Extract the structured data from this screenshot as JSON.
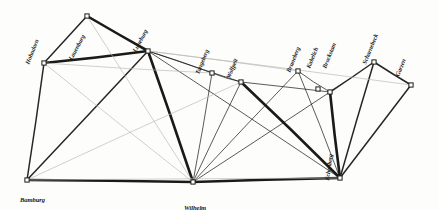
{
  "figure": {
    "kind": "hand-drawn-triangulation-network",
    "background_color": "#fdfdfc",
    "ink_color": "#1a1a18",
    "faint_ink_color": "#b9b9b4",
    "width": 438,
    "height": 210
  },
  "chart_data": {
    "type": "scatter",
    "title": "",
    "subtitle": "",
    "xlabel": "",
    "ylabel": "",
    "grid": false,
    "legend": "none",
    "xlim": [
      0,
      438
    ],
    "ylim": [
      0,
      210
    ],
    "nodes": [
      {
        "id": "hohndorn",
        "label": "Hohndorn",
        "x": 44,
        "y": 63,
        "label_x": 30,
        "label_y": 58,
        "label_rot": -68
      },
      {
        "id": "lauenburg",
        "label": "Lauenburg",
        "x": 87,
        "y": 16,
        "label_x": 73,
        "label_y": 54,
        "label_rot": -62
      },
      {
        "id": "luneburg",
        "label": "Luneburg",
        "x": 148,
        "y": 51,
        "label_x": 137,
        "label_y": 46,
        "label_rot": -62
      },
      {
        "id": "tangeberg",
        "label": "Tangeberg",
        "x": 212,
        "y": 73,
        "label_x": 200,
        "label_y": 68,
        "label_rot": -68
      },
      {
        "id": "wolfpeit",
        "label": "Wolfpeit",
        "x": 241,
        "y": 82,
        "label_x": 231,
        "label_y": 72,
        "label_rot": -68
      },
      {
        "id": "bruneberg",
        "label": "Bruneberg",
        "x": 298,
        "y": 71,
        "label_x": 291,
        "label_y": 66,
        "label_rot": -68
      },
      {
        "id": "kabelich",
        "label": "Kabelich",
        "x": 318,
        "y": 89,
        "label_x": 311,
        "label_y": 62,
        "label_rot": -68
      },
      {
        "id": "brockstam",
        "label": "Brockstam",
        "x": 330,
        "y": 92,
        "label_x": 327,
        "label_y": 62,
        "label_rot": -68
      },
      {
        "id": "scharnebeck",
        "label": "Scharnebeck",
        "x": 374,
        "y": 62,
        "label_x": 367,
        "label_y": 58,
        "label_rot": -68
      },
      {
        "id": "garzen",
        "label": "Garzen",
        "x": 411,
        "y": 85,
        "label_x": 400,
        "label_y": 70,
        "label_rot": -68
      },
      {
        "id": "echenberg",
        "label": "Echenberg",
        "x": 340,
        "y": 178,
        "label_x": 330,
        "label_y": 174,
        "label_rot": -82
      },
      {
        "id": "bamburg",
        "label": "Bamburg",
        "x": 27,
        "y": 180,
        "label_x": 20,
        "label_y": 196,
        "label_rot": 0
      },
      {
        "id": "wilhelm",
        "label": "Wilhelm",
        "x": 193,
        "y": 182,
        "label_x": 184,
        "label_y": 204,
        "label_rot": 0
      }
    ],
    "edges": [
      {
        "from": "hohndorn",
        "to": "lauenburg",
        "weight": "medium"
      },
      {
        "from": "lauenburg",
        "to": "luneburg",
        "weight": "heavy"
      },
      {
        "from": "hohndorn",
        "to": "luneburg",
        "weight": "heavy"
      },
      {
        "from": "hohndorn",
        "to": "bamburg",
        "weight": "medium"
      },
      {
        "from": "bamburg",
        "to": "luneburg",
        "weight": "medium"
      },
      {
        "from": "bamburg",
        "to": "wilhelm",
        "weight": "heavy"
      },
      {
        "from": "luneburg",
        "to": "wilhelm",
        "weight": "heavy"
      },
      {
        "from": "luneburg",
        "to": "tangeberg",
        "weight": "light"
      },
      {
        "from": "luneburg",
        "to": "wolfpeit",
        "weight": "light"
      },
      {
        "from": "luneburg",
        "to": "bruneberg",
        "weight": "faint"
      },
      {
        "from": "luneburg",
        "to": "echenberg",
        "weight": "light"
      },
      {
        "from": "tangeberg",
        "to": "wolfpeit",
        "weight": "light"
      },
      {
        "from": "tangeberg",
        "to": "wilhelm",
        "weight": "light"
      },
      {
        "from": "wolfpeit",
        "to": "wilhelm",
        "weight": "light"
      },
      {
        "from": "wolfpeit",
        "to": "echenberg",
        "weight": "heavy"
      },
      {
        "from": "wolfpeit",
        "to": "brockstam",
        "weight": "light"
      },
      {
        "from": "bruneberg",
        "to": "brockstam",
        "weight": "light"
      },
      {
        "from": "bruneberg",
        "to": "echenberg",
        "weight": "light"
      },
      {
        "from": "brockstam",
        "to": "echenberg",
        "weight": "heavy"
      },
      {
        "from": "brockstam",
        "to": "scharnebeck",
        "weight": "medium"
      },
      {
        "from": "scharnebeck",
        "to": "garzen",
        "weight": "medium"
      },
      {
        "from": "scharnebeck",
        "to": "echenberg",
        "weight": "medium"
      },
      {
        "from": "garzen",
        "to": "echenberg",
        "weight": "medium"
      },
      {
        "from": "wilhelm",
        "to": "echenberg",
        "weight": "heavy"
      },
      {
        "from": "wilhelm",
        "to": "brockstam",
        "weight": "light"
      },
      {
        "from": "wilhelm",
        "to": "bruneberg",
        "weight": "light"
      },
      {
        "from": "bamburg",
        "to": "echenberg",
        "weight": "faint"
      },
      {
        "from": "hohndorn",
        "to": "wilhelm",
        "weight": "faint"
      },
      {
        "from": "lauenburg",
        "to": "wilhelm",
        "weight": "faint"
      },
      {
        "from": "hohndorn",
        "to": "tangeberg",
        "weight": "faint"
      },
      {
        "from": "luneburg",
        "to": "garzen",
        "weight": "faint"
      },
      {
        "from": "bamburg",
        "to": "wolfpeit",
        "weight": "faint"
      }
    ]
  }
}
